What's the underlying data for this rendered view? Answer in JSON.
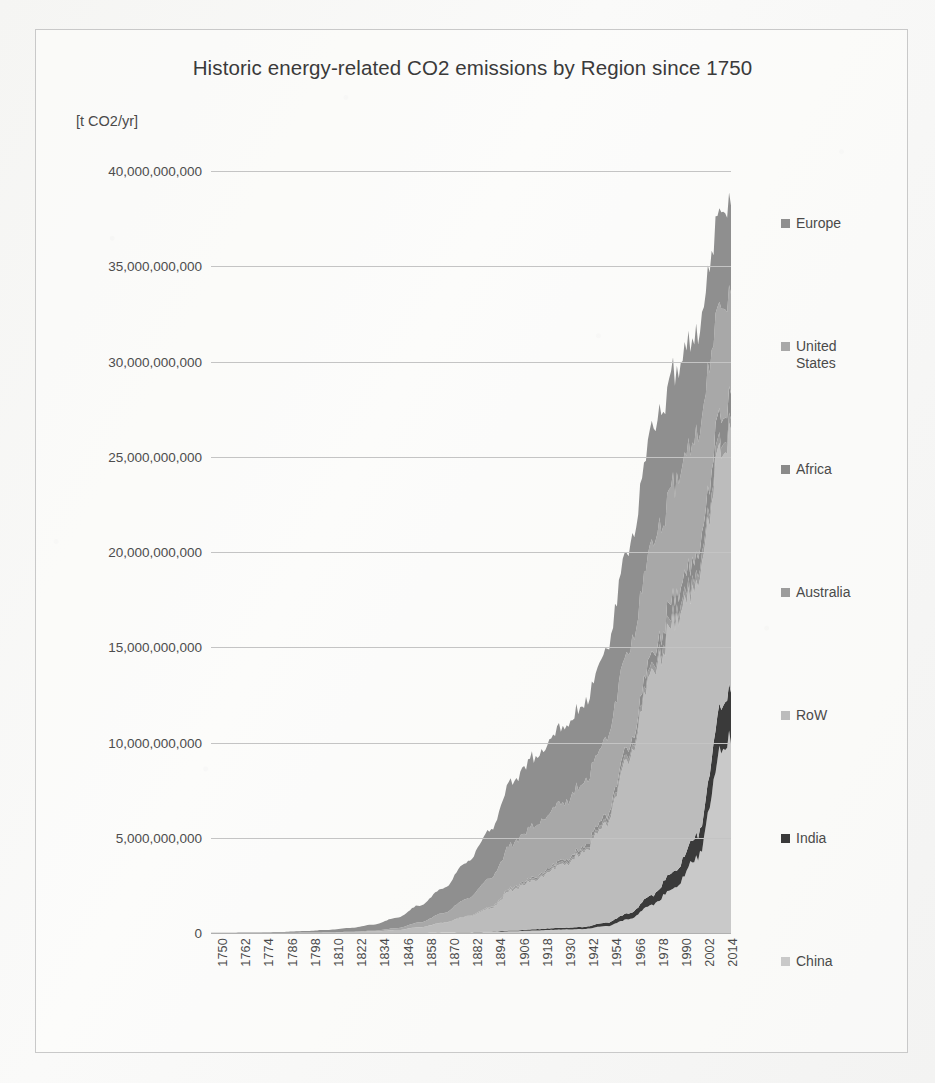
{
  "chart_data": {
    "type": "area",
    "stacked": true,
    "title": "Historic energy-related CO2 emissions by Region since 1750",
    "ylabel": "[t CO2/yr]",
    "xlabel": "",
    "grid": true,
    "legend_position": "right",
    "ylim": [
      0,
      40000000000
    ],
    "ytick_labels": [
      "40,000,000,000",
      "35,000,000,000",
      "30,000,000,000",
      "25,000,000,000",
      "20,000,000,000",
      "15,000,000,000",
      "10,000,000,000",
      "5,000,000,000",
      "0"
    ],
    "ytick_values": [
      40000000000,
      35000000000,
      30000000000,
      25000000000,
      20000000000,
      15000000000,
      10000000000,
      5000000000,
      0
    ],
    "xlim": [
      1750,
      2019
    ],
    "xtick_labels": [
      "1750",
      "1762",
      "1774",
      "1786",
      "1798",
      "1810",
      "1822",
      "1834",
      "1846",
      "1858",
      "1870",
      "1882",
      "1894",
      "1906",
      "1918",
      "1930",
      "1942",
      "1954",
      "1966",
      "1978",
      "1990",
      "2002",
      "2014"
    ],
    "xtick_values": [
      1750,
      1762,
      1774,
      1786,
      1798,
      1810,
      1822,
      1834,
      1846,
      1858,
      1870,
      1882,
      1894,
      1906,
      1918,
      1930,
      1942,
      1954,
      1966,
      1978,
      1990,
      2002,
      2014
    ],
    "legend": [
      {
        "label": "Europe",
        "color": "#8f8f8f"
      },
      {
        "label": "United\nStates",
        "color": "#a8a8a8"
      },
      {
        "label": "Africa",
        "color": "#8a8a8a"
      },
      {
        "label": "Australia",
        "color": "#9c9c9c"
      },
      {
        "label": "RoW",
        "color": "#bcbcbc"
      },
      {
        "label": "India",
        "color": "#3a3a3a"
      },
      {
        "label": "China",
        "color": "#c9c9c9"
      }
    ],
    "x": [
      1750,
      1762,
      1774,
      1786,
      1798,
      1810,
      1822,
      1834,
      1846,
      1858,
      1870,
      1882,
      1894,
      1906,
      1918,
      1930,
      1942,
      1954,
      1966,
      1978,
      1990,
      2002,
      2014,
      2019
    ],
    "series": [
      {
        "name": "China",
        "color": "#c9c9c9",
        "values": [
          0,
          0,
          0,
          0,
          0,
          0,
          0,
          0,
          0,
          0,
          20000000,
          30000000,
          50000000,
          90000000,
          130000000,
          180000000,
          200000000,
          350000000,
          700000000,
          1500000000,
          2400000000,
          4000000000,
          9700000000,
          10200000000
        ]
      },
      {
        "name": "India",
        "color": "#3a3a3a",
        "values": [
          0,
          0,
          0,
          0,
          0,
          0,
          0,
          0,
          0,
          0,
          5000000,
          10000000,
          20000000,
          40000000,
          70000000,
          90000000,
          110000000,
          180000000,
          300000000,
          500000000,
          900000000,
          1200000000,
          2300000000,
          2600000000
        ]
      },
      {
        "name": "RoW",
        "color": "#bcbcbc",
        "values": [
          3000000,
          4000000,
          6000000,
          10000000,
          20000000,
          30000000,
          50000000,
          80000000,
          150000000,
          300000000,
          500000000,
          800000000,
          1200000000,
          2100000000,
          2600000000,
          3200000000,
          3800000000,
          5200000000,
          8200000000,
          11500000000,
          13000000000,
          13200000000,
          13800000000,
          13600000000
        ]
      },
      {
        "name": "Australia",
        "color": "#9c9c9c",
        "values": [
          0,
          0,
          0,
          0,
          0,
          0,
          0,
          0,
          0,
          3000000,
          8000000,
          20000000,
          40000000,
          70000000,
          90000000,
          110000000,
          130000000,
          180000000,
          250000000,
          350000000,
          450000000,
          500000000,
          550000000,
          540000000
        ]
      },
      {
        "name": "Africa",
        "color": "#8a8a8a",
        "values": [
          0,
          0,
          0,
          0,
          0,
          0,
          0,
          0,
          0,
          2000000,
          6000000,
          12000000,
          25000000,
          50000000,
          80000000,
          110000000,
          150000000,
          250000000,
          400000000,
          600000000,
          850000000,
          1000000000,
          1300000000,
          1350000000
        ]
      },
      {
        "name": "United States",
        "color": "#a8a8a8",
        "values": [
          0,
          0,
          0,
          0,
          1000000,
          5000000,
          15000000,
          40000000,
          100000000,
          250000000,
          500000000,
          900000000,
          1500000000,
          2300000000,
          2700000000,
          3000000000,
          3300000000,
          4000000000,
          5000000000,
          5800000000,
          5900000000,
          6400000000,
          5800000000,
          5400000000
        ]
      },
      {
        "name": "Europe",
        "color": "#8f8f8f",
        "values": [
          10000000,
          15000000,
          25000000,
          45000000,
          80000000,
          130000000,
          200000000,
          320000000,
          550000000,
          900000000,
          1300000000,
          1900000000,
          2500000000,
          3300000000,
          3600000000,
          3900000000,
          4000000000,
          4600000000,
          5400000000,
          6000000000,
          5800000000,
          5300000000,
          4900000000,
          4700000000
        ]
      }
    ]
  }
}
